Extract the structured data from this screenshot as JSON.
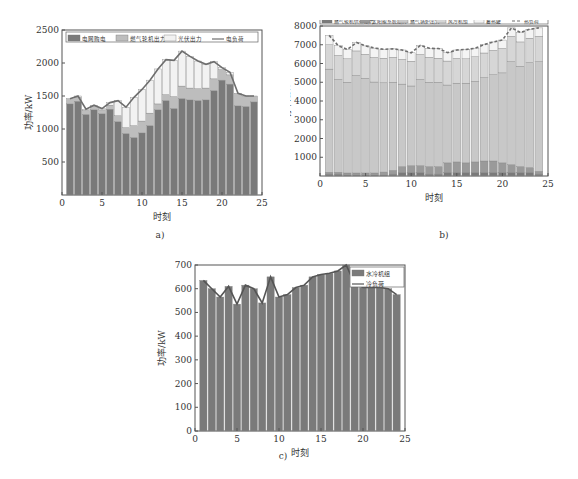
{
  "chart_data": [
    {
      "id": "a",
      "type": "bar",
      "stacked": true,
      "caption": "a)",
      "title": "",
      "xlabel": "时刻",
      "ylabel": "功率/kW",
      "xlim": [
        0,
        25
      ],
      "ylim": [
        0,
        2500
      ],
      "xticks": [
        0,
        5,
        10,
        15,
        20,
        25
      ],
      "yticks": [
        500,
        1000,
        1500,
        2000,
        2500
      ],
      "legend_position": "top-inside",
      "x": [
        1,
        2,
        3,
        4,
        5,
        6,
        7,
        8,
        9,
        10,
        11,
        12,
        13,
        14,
        15,
        16,
        17,
        18,
        19,
        20,
        21,
        22,
        23,
        24
      ],
      "series": [
        {
          "name": "电网购电",
          "kind": "bar",
          "color": "#7a7a7a",
          "values": [
            1380,
            1420,
            1220,
            1290,
            1230,
            1300,
            1110,
            930,
            870,
            940,
            1050,
            1290,
            1430,
            1310,
            1460,
            1440,
            1430,
            1440,
            1580,
            1740,
            1680,
            1350,
            1340,
            1410
          ]
        },
        {
          "name": "燃气轮机出力",
          "kind": "bar",
          "color": "#bdbdbd",
          "values": [
            80,
            60,
            60,
            50,
            60,
            60,
            90,
            90,
            180,
            180,
            190,
            90,
            90,
            180,
            190,
            180,
            180,
            180,
            180,
            160,
            140,
            190,
            160,
            90
          ]
        },
        {
          "name": "光伏出力",
          "kind": "bar",
          "color": "#f2f2f2",
          "values": [
            0,
            20,
            20,
            20,
            20,
            40,
            230,
            310,
            430,
            480,
            500,
            530,
            530,
            550,
            530,
            480,
            420,
            360,
            260,
            30,
            40,
            0,
            0,
            0
          ]
        },
        {
          "name": "电负荷",
          "kind": "line",
          "color": "#6e6e6e",
          "values": [
            1460,
            1500,
            1300,
            1360,
            1310,
            1400,
            1430,
            1330,
            1480,
            1600,
            1740,
            1910,
            2050,
            2040,
            2180,
            2100,
            2030,
            1980,
            2020,
            1930,
            1860,
            1540,
            1500,
            1500
          ]
        }
      ]
    },
    {
      "id": "b",
      "type": "bar",
      "stacked": true,
      "caption": "b)",
      "title": "",
      "xlabel": "时刻",
      "ylabel": "功率/kW",
      "xlim": [
        0,
        25
      ],
      "ylim": [
        0,
        8000
      ],
      "xticks": [
        0,
        5,
        10,
        15,
        20,
        25
      ],
      "yticks": [
        1000,
        2000,
        3000,
        4000,
        5000,
        6000,
        7000,
        8000
      ],
      "legend_position": "top-outside",
      "x": [
        1,
        2,
        3,
        4,
        5,
        6,
        7,
        8,
        9,
        10,
        11,
        12,
        13,
        14,
        15,
        16,
        17,
        18,
        19,
        20,
        21,
        22,
        23,
        24
      ],
      "series": [
        {
          "name": "燃气轮机供热出力",
          "kind": "bar",
          "color": "#7a7a7a",
          "values": [
            100,
            100,
            60,
            60,
            60,
            60,
            60,
            100,
            200,
            200,
            200,
            100,
            100,
            200,
            200,
            200,
            200,
            200,
            200,
            200,
            200,
            200,
            200,
            100
          ]
        },
        {
          "name": "太阳能系统出力",
          "kind": "bar",
          "color": "#9a9a9a",
          "values": [
            100,
            100,
            100,
            100,
            100,
            100,
            150,
            200,
            300,
            350,
            350,
            400,
            400,
            500,
            550,
            500,
            550,
            600,
            600,
            500,
            400,
            300,
            250,
            150
          ]
        },
        {
          "name": "燃气锅炉出力",
          "kind": "bar",
          "color": "#c8c8c8",
          "values": [
            5500,
            4950,
            4840,
            5200,
            5050,
            4850,
            4760,
            4700,
            4400,
            4250,
            4600,
            4500,
            4500,
            4150,
            4200,
            4250,
            4300,
            4450,
            4600,
            4800,
            5500,
            5350,
            5600,
            5850
          ]
        },
        {
          "name": "风冷机组",
          "kind": "bar",
          "color": "#d6d6d6",
          "values": [
            1300,
            1280,
            1250,
            1310,
            1280,
            1310,
            1310,
            1330,
            1320,
            1320,
            1330,
            1330,
            1280,
            1280,
            1320,
            1300,
            1310,
            1310,
            1300,
            1300,
            1350,
            1300,
            1300,
            1350
          ]
        },
        {
          "name": "蓄热罐",
          "kind": "bar",
          "color": "#f4f4f4",
          "values": [
            500,
            520,
            500,
            450,
            450,
            500,
            480,
            450,
            500,
            450,
            480,
            480,
            520,
            450,
            450,
            500,
            450,
            450,
            450,
            450,
            450,
            500,
            480,
            450
          ]
        },
        {
          "name": "热负荷",
          "kind": "line",
          "dashed": true,
          "color": "#6e6e6e",
          "values": [
            7500,
            6950,
            6750,
            7120,
            6940,
            6820,
            6760,
            6780,
            6720,
            6570,
            6960,
            6810,
            6800,
            6580,
            6720,
            6750,
            6810,
            7010,
            7150,
            7250,
            7900,
            7650,
            7830,
            7900
          ]
        }
      ]
    },
    {
      "id": "c",
      "type": "bar",
      "stacked": false,
      "caption": "c)",
      "title": "",
      "xlabel": "时刻",
      "ylabel": "功率/kW",
      "xlim": [
        0,
        25
      ],
      "ylim": [
        0,
        700
      ],
      "xticks": [
        0,
        5,
        10,
        15,
        20,
        25
      ],
      "yticks": [
        0,
        100,
        200,
        300,
        400,
        500,
        600,
        700
      ],
      "legend_position": "top-right-inside",
      "x": [
        1,
        2,
        3,
        4,
        5,
        6,
        7,
        8,
        9,
        10,
        11,
        12,
        13,
        14,
        15,
        16,
        17,
        18,
        19,
        20,
        21,
        22,
        23,
        24
      ],
      "series": [
        {
          "name": "水冷机组",
          "kind": "bar",
          "color": "#7a7a7a",
          "values": [
            635,
            600,
            565,
            610,
            535,
            615,
            600,
            540,
            650,
            565,
            575,
            605,
            615,
            650,
            660,
            665,
            675,
            700,
            620,
            605,
            605,
            605,
            600,
            575
          ]
        },
        {
          "name": "冷负荷",
          "kind": "line",
          "color": "#555555",
          "values": [
            635,
            600,
            565,
            610,
            535,
            615,
            600,
            540,
            650,
            565,
            575,
            605,
            615,
            650,
            660,
            665,
            675,
            700,
            620,
            605,
            605,
            605,
            600,
            575
          ]
        }
      ]
    }
  ]
}
